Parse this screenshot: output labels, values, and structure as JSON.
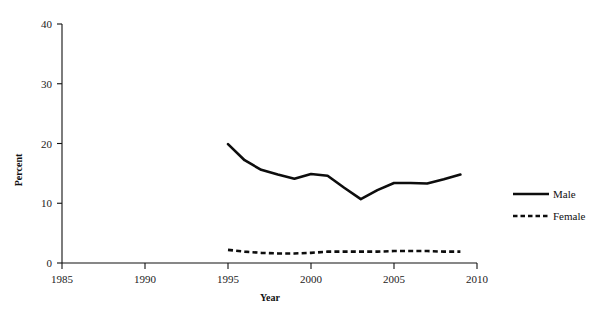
{
  "chart_data": {
    "type": "line",
    "title": "",
    "xlabel": "Year",
    "ylabel": "Percent",
    "xlim": [
      1985,
      2010
    ],
    "ylim": [
      0,
      40
    ],
    "xticks": [
      1985,
      1990,
      1995,
      2000,
      2005,
      2010
    ],
    "yticks": [
      0,
      10,
      20,
      30,
      40
    ],
    "xtick_labels": [
      "1985",
      "1990",
      "1995",
      "2000",
      "2005",
      "2010"
    ],
    "ytick_labels": [
      "0",
      "10",
      "20",
      "30",
      "40"
    ],
    "grid": false,
    "legend_position": "right",
    "x": [
      1995,
      1996,
      1997,
      1998,
      1999,
      2000,
      2001,
      2002,
      2003,
      2004,
      2005,
      2006,
      2007,
      2008,
      2009
    ],
    "series": [
      {
        "name": "Male",
        "style": "solid",
        "color": "#0d0d0d",
        "values": [
          19.9,
          17.2,
          15.6,
          14.8,
          14.1,
          14.9,
          14.6,
          12.6,
          10.7,
          12.2,
          13.4,
          13.4,
          13.3,
          14.0,
          14.8
        ]
      },
      {
        "name": "Female",
        "style": "dashed",
        "color": "#0d0d0d",
        "values": [
          2.2,
          1.9,
          1.7,
          1.6,
          1.6,
          1.7,
          1.9,
          1.9,
          1.9,
          1.9,
          2.0,
          2.0,
          2.0,
          1.9,
          1.9
        ]
      }
    ]
  },
  "axes": {
    "x_axis_label": "Year",
    "y_axis_label": "Percent"
  },
  "legend": {
    "items": [
      {
        "label": "Male",
        "style": "solid"
      },
      {
        "label": "Female",
        "style": "dashed"
      }
    ]
  }
}
